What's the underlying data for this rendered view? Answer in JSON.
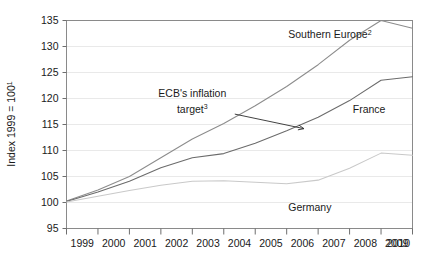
{
  "chart_data": {
    "type": "line",
    "title": "",
    "xlabel": "",
    "ylabel": "Index 1999 = 100",
    "ylabel_sup": "1",
    "ylim": [
      95,
      135
    ],
    "yticks": [
      95,
      100,
      105,
      110,
      115,
      120,
      125,
      130,
      135
    ],
    "ytick_labels": [
      "95",
      "100",
      "105",
      "110",
      "115",
      "120",
      "125",
      "130",
      "135"
    ],
    "xlim": [
      1999,
      2010
    ],
    "x": [
      1999,
      2000,
      2001,
      2002,
      2003,
      2004,
      2005,
      2006,
      2007,
      2008,
      2009,
      2010
    ],
    "xtick_labels": [
      "1999",
      "2000",
      "2001",
      "2002",
      "2003",
      "2004",
      "2005",
      "2006",
      "2007",
      "2008",
      "2009",
      "2010"
    ],
    "grid": true,
    "legend_position": "inline-labels",
    "series": [
      {
        "name": "Southern Europe",
        "name_sup": "2",
        "color": "#8c8c8c",
        "label_x": 2006.05,
        "label_y": 131.6,
        "values": [
          100.3,
          102.4,
          105.0,
          108.6,
          112.2,
          115.2,
          118.6,
          122.3,
          126.5,
          131.2,
          135.0,
          133.5
        ]
      },
      {
        "name": "France",
        "name_sup": "",
        "color": "#6b6b6b",
        "label_x": 2008.1,
        "label_y": 117.2,
        "values": [
          100.2,
          102.0,
          104.1,
          106.7,
          108.6,
          109.4,
          111.4,
          113.8,
          116.4,
          119.6,
          123.5,
          124.2
        ]
      },
      {
        "name": "Germany",
        "name_sup": "",
        "color": "#c9c9c9",
        "label_x": 2006.05,
        "label_y": 98.3,
        "values": [
          100.1,
          101.2,
          102.3,
          103.3,
          104.1,
          104.2,
          103.9,
          103.6,
          104.3,
          106.6,
          109.5,
          109.1
        ]
      }
    ],
    "annotations": [
      {
        "name": "ecb-inflation-target",
        "line1": "ECB's inflation",
        "line2": "target",
        "sup": "3",
        "text_x": 2003.0,
        "text_y_line1": 120.3,
        "text_y_line2": 117.3,
        "arrow_from_x": 2004.35,
        "arrow_from_y": 117.0,
        "arrow_to_x": 2006.55,
        "arrow_to_y": 114.2
      }
    ]
  }
}
